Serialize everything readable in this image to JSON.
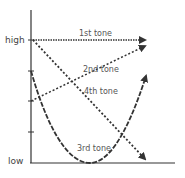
{
  "diagram": {
    "axis": {
      "y_high_label": "high",
      "y_low_label": "low"
    },
    "tones": [
      {
        "label": "1st tone",
        "shape": "level high",
        "style": "dotted"
      },
      {
        "label": "2nd tone",
        "shape": "rising",
        "style": "dashed"
      },
      {
        "label": "3rd tone",
        "shape": "dipping",
        "style": "dash"
      },
      {
        "label": "4th tone",
        "shape": "falling",
        "style": "dotted"
      }
    ],
    "colors": {
      "line": "#333333",
      "text": "#555555",
      "background": "#ffffff"
    }
  }
}
